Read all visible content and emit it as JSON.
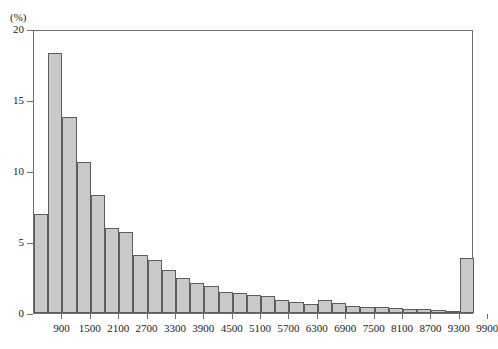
{
  "chart_data": {
    "type": "bar",
    "title": "",
    "subtitle": "",
    "xlabel": "",
    "ylabel": "",
    "yunit_label": "(%)",
    "grid": false,
    "legend": "none",
    "bin_width": 300,
    "ylim": [
      0,
      20
    ],
    "xlim": [
      600,
      9900
    ],
    "ytick_labels": [
      "0",
      "5",
      "10",
      "15",
      "20"
    ],
    "ytick_values": [
      0,
      5,
      10,
      15,
      20
    ],
    "xtick_labels": [
      "900",
      "1500",
      "2100",
      "2700",
      "3300",
      "3900",
      "4500",
      "5100",
      "5700",
      "6300",
      "6900",
      "7500",
      "8100",
      "8700",
      "9300",
      "9900"
    ],
    "xtick_values": [
      900,
      1500,
      2100,
      2700,
      3300,
      3900,
      4500,
      5100,
      5700,
      6300,
      6900,
      7500,
      8100,
      8700,
      9300,
      9900
    ],
    "bin_starts": [
      600,
      900,
      1200,
      1500,
      1800,
      2100,
      2400,
      2700,
      3000,
      3300,
      3600,
      3900,
      4200,
      4500,
      4800,
      5100,
      5400,
      5700,
      6000,
      6300,
      6600,
      6900,
      7200,
      7500,
      7800,
      8100,
      8400,
      8700,
      9000,
      9300,
      9600
    ],
    "values": [
      7.0,
      18.3,
      13.8,
      10.6,
      8.3,
      6.0,
      5.7,
      4.1,
      3.7,
      3.0,
      2.5,
      2.1,
      1.9,
      1.5,
      1.4,
      1.3,
      1.2,
      0.9,
      0.8,
      0.6,
      0.9,
      0.7,
      0.5,
      0.4,
      0.4,
      0.35,
      0.3,
      0.3,
      0.2,
      0.15,
      3.9
    ],
    "bar_fill_color": "#c9c9c9",
    "bar_edge_color": "#5d5d5d",
    "axis_color": "#6f6f6f"
  }
}
